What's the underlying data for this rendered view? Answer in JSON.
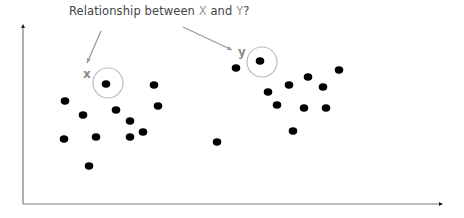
{
  "title": {
    "prefix": "Relationship between ",
    "var_x": "X",
    "mid": " and ",
    "var_y": "Y",
    "suffix": "?"
  },
  "labels": {
    "x_marker": "x",
    "y_marker": "y"
  },
  "colors": {
    "axis": "#7a7a7a",
    "dot": "#000000",
    "circle": "#bdbdbd",
    "arrow": "#9a9a9a",
    "title": "#444444"
  },
  "chart_data": {
    "type": "scatter",
    "title": "Relationship between X and Y?",
    "xlabel": "",
    "ylabel": "",
    "grid": false,
    "axes": {
      "origin_px": [
        23,
        204
      ],
      "x_end_px": 442,
      "y_top_px": 25
    },
    "highlighted": [
      {
        "name": "x",
        "point_px": [
          106,
          84
        ],
        "circle_center_px": [
          108,
          83
        ],
        "circle_r": 15
      },
      {
        "name": "y",
        "point_px": [
          260,
          61
        ],
        "circle_center_px": [
          262,
          62
        ],
        "circle_r": 15
      }
    ],
    "clusters": [
      {
        "name": "left cluster",
        "points_px": [
          [
            106,
            84
          ],
          [
            154,
            85
          ],
          [
            65,
            101
          ],
          [
            158,
            106
          ],
          [
            83,
            115
          ],
          [
            116,
            110
          ],
          [
            130,
            121
          ],
          [
            143,
            132
          ],
          [
            64,
            139
          ],
          [
            96,
            137
          ],
          [
            130,
            137
          ],
          [
            89,
            166
          ]
        ]
      },
      {
        "name": "right cluster",
        "points_px": [
          [
            260,
            61
          ],
          [
            236,
            68
          ],
          [
            339,
            70
          ],
          [
            308,
            77
          ],
          [
            289,
            85
          ],
          [
            323,
            87
          ],
          [
            268,
            92
          ],
          [
            277,
            105
          ],
          [
            304,
            108
          ],
          [
            326,
            108
          ],
          [
            293,
            131
          ]
        ]
      },
      {
        "name": "outlier",
        "points_px": [
          [
            217,
            142
          ]
        ]
      }
    ],
    "arrows": [
      {
        "from_px": [
          101,
          31
        ],
        "to_px": [
          87,
          63
        ]
      },
      {
        "from_px": [
          183,
          27
        ],
        "to_px": [
          232,
          50
        ]
      }
    ]
  }
}
